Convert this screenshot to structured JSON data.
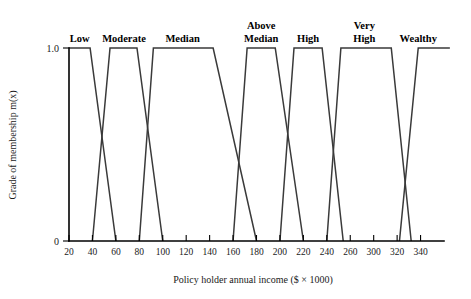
{
  "chart_data": {
    "type": "line",
    "title": "",
    "xlabel": "Policy holder annual income ($ × 1000)",
    "ylabel": "Grade of membership m(x)",
    "xlim": [
      20,
      340
    ],
    "ylim": [
      0,
      1.0
    ],
    "grid": false,
    "legend_position": "above-curve-labels",
    "x_tick_labels": [
      "20",
      "40",
      "60",
      "80",
      "100",
      "120",
      "140",
      "160",
      "180",
      "200",
      "220",
      "240",
      "260",
      "300",
      "320",
      "340"
    ],
    "x_tick_values": [
      20,
      40,
      60,
      80,
      100,
      120,
      140,
      160,
      180,
      200,
      220,
      240,
      260,
      280,
      300,
      320
    ],
    "y_tick_labels": [
      "0",
      "1.0"
    ],
    "y_tick_values": [
      0,
      1.0
    ],
    "series": [
      {
        "name": "Low",
        "label": "Low",
        "label_lines": [
          "Low"
        ],
        "label_x": 29,
        "shape": "trapezoid",
        "points": [
          [
            20,
            1.0
          ],
          [
            38,
            1.0
          ],
          [
            60,
            0
          ]
        ]
      },
      {
        "name": "Moderate",
        "label": "Moderate",
        "label_lines": [
          "Moderate"
        ],
        "label_x": 67,
        "shape": "trapezoid",
        "points": [
          [
            40,
            0
          ],
          [
            55,
            1.0
          ],
          [
            78,
            1.0
          ],
          [
            100,
            0
          ]
        ]
      },
      {
        "name": "Median",
        "label": "Median",
        "label_lines": [
          "Median"
        ],
        "label_x": 117,
        "shape": "trapezoid",
        "points": [
          [
            80,
            0
          ],
          [
            92,
            1.0
          ],
          [
            143,
            1.0
          ],
          [
            180,
            0
          ]
        ]
      },
      {
        "name": "Above Median",
        "label": "Above Median",
        "label_lines": [
          "Above",
          "Median"
        ],
        "label_x": 184,
        "shape": "trapezoid",
        "points": [
          [
            160,
            0
          ],
          [
            172,
            1.0
          ],
          [
            196,
            1.0
          ],
          [
            220,
            0
          ]
        ]
      },
      {
        "name": "High",
        "label": "High",
        "label_lines": [
          "High"
        ],
        "label_x": 224,
        "shape": "trapezoid",
        "points": [
          [
            200,
            0
          ],
          [
            212,
            1.0
          ],
          [
            236,
            1.0
          ],
          [
            254,
            0
          ]
        ]
      },
      {
        "name": "Very High",
        "label": "Very High",
        "label_lines": [
          "Very",
          "High"
        ],
        "label_x": 272,
        "shape": "trapezoid",
        "points": [
          [
            240,
            0
          ],
          [
            252,
            1.0
          ],
          [
            295,
            1.0
          ],
          [
            312,
            0
          ]
        ]
      },
      {
        "name": "Wealthy",
        "label": "Wealthy",
        "label_lines": [
          "Wealthy"
        ],
        "label_x": 318,
        "shape": "trapezoid",
        "points": [
          [
            302,
            0
          ],
          [
            318,
            1.0
          ],
          [
            345,
            1.0
          ]
        ]
      }
    ]
  },
  "figure": {
    "background_color": "#ffffff",
    "line_color": "#3a3a3a",
    "axis_color": "#000000"
  }
}
